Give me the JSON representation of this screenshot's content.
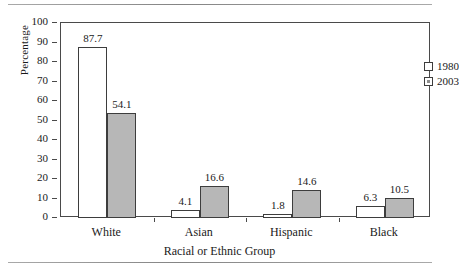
{
  "chart_data": {
    "type": "bar",
    "title": "",
    "xlabel": "Racial or Ethnic Group",
    "ylabel": "Percentage",
    "categories": [
      "White",
      "Asian",
      "Hispanic",
      "Black"
    ],
    "series": [
      {
        "name": "1980",
        "values": [
          87.7,
          4.1,
          1.8,
          6.3
        ],
        "color": "#ffffff"
      },
      {
        "name": "2003",
        "values": [
          54.1,
          16.6,
          14.6,
          10.5
        ],
        "color": "#b7b7b7"
      }
    ],
    "ylim": [
      0,
      100
    ],
    "y_ticks": [
      0,
      10,
      20,
      30,
      40,
      50,
      60,
      70,
      80,
      90,
      100
    ],
    "y_tick_labels": [
      "0",
      "10",
      "20",
      "30",
      "40",
      "50",
      "60",
      "70",
      "80",
      "90",
      "100"
    ],
    "grid": false,
    "legend_position": "top-right",
    "data_labels": [
      [
        "87.7",
        "54.1"
      ],
      [
        "4.1",
        "16.6"
      ],
      [
        "1.8",
        "14.6"
      ],
      [
        "6.3",
        "10.5"
      ]
    ]
  },
  "axes": {
    "y_title": "Percentage",
    "x_title": "Racial or Ethnic Group"
  },
  "legend": {
    "items": [
      {
        "label": "1980",
        "swatch": "white-square"
      },
      {
        "label": "2003",
        "swatch": "gray-square"
      }
    ]
  }
}
